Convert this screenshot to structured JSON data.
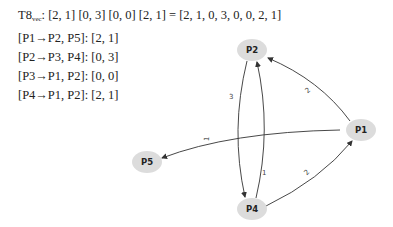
{
  "formulas": {
    "vector_prefix": "T8",
    "vector_sub": "vec",
    "vector_rest": ": [2, 1] [0, 3] [0, 0] [2, 1]  = [2, 1, 0, 3, 0, 0, 2, 1]",
    "lines": [
      "[P1→P2, P5]:  [2, 1]",
      "[P2→P3, P4]:  [0, 3]",
      "[P3→P1, P2]: [0, 0]",
      "[P4→P1, P2]: [2, 1]"
    ]
  },
  "graph": {
    "node_color": "#dcdcdc",
    "edge_color": "#333333",
    "nodes": {
      "p1": {
        "label": "P1"
      },
      "p2": {
        "label": "P2"
      },
      "p4": {
        "label": "P4"
      },
      "p5": {
        "label": "P5"
      }
    },
    "edges": [
      {
        "from": "P1",
        "to": "P2",
        "label": "2"
      },
      {
        "from": "P1",
        "to": "P5",
        "label": "1"
      },
      {
        "from": "P2",
        "to": "P4",
        "label": "3"
      },
      {
        "from": "P4",
        "to": "P2",
        "label": "1"
      },
      {
        "from": "P4",
        "to": "P1",
        "label": "2"
      }
    ]
  }
}
